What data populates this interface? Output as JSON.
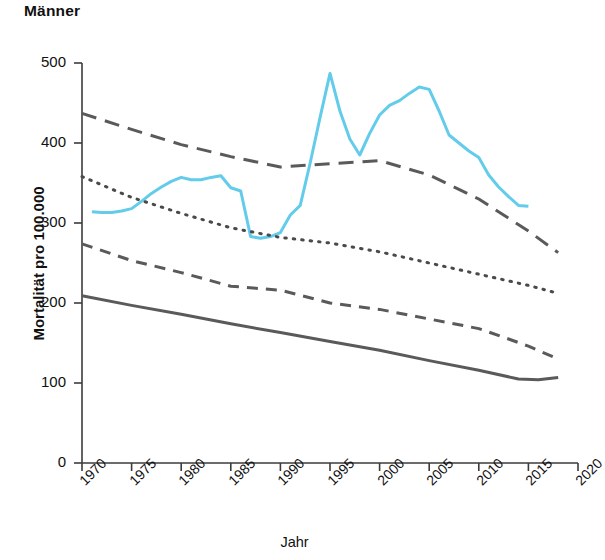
{
  "title": "Männer",
  "axes": {
    "y_label": "Mortalität pro 100.000",
    "x_label": "Jahr",
    "y_ticks": [
      "0",
      "100",
      "200",
      "300",
      "400",
      "500"
    ],
    "x_ticks": [
      "1970",
      "1975",
      "1980",
      "1985",
      "1990",
      "1995",
      "2000",
      "2005",
      "2010",
      "2015",
      "2020"
    ]
  },
  "colors": {
    "highlight": "#62CCEA",
    "line_gray": "#5a5a5a",
    "axis": "#3b3b3b",
    "text": "#111111",
    "background": "#ffffff"
  },
  "chart_data": {
    "type": "line",
    "title": "Männer",
    "xlabel": "Jahr",
    "ylabel": "Mortalität pro 100.000",
    "xlim": [
      1970,
      2020
    ],
    "ylim": [
      0,
      500
    ],
    "yticks": [
      0,
      100,
      200,
      300,
      400,
      500
    ],
    "xticks": [
      1970,
      1975,
      1980,
      1985,
      1990,
      1995,
      2000,
      2005,
      2010,
      2015,
      2020
    ],
    "grid": false,
    "legend": "none",
    "series": [
      {
        "name": "highlight-cyan",
        "style": "solid",
        "color": "#62CCEA",
        "linewidth": 3,
        "x": [
          1971,
          1972,
          1973,
          1974,
          1975,
          1976,
          1977,
          1978,
          1979,
          1980,
          1981,
          1982,
          1983,
          1984,
          1985,
          1986,
          1987,
          1988,
          1989,
          1990,
          1991,
          1992,
          1993,
          1994,
          1995,
          1996,
          1997,
          1998,
          1999,
          2000,
          2001,
          2002,
          2003,
          2004,
          2005,
          2006,
          2007,
          2008,
          2009,
          2010,
          2011,
          2012,
          2013,
          2014,
          2015
        ],
        "y": [
          314,
          313,
          313,
          315,
          318,
          327,
          337,
          345,
          352,
          357,
          354,
          354,
          357,
          359,
          344,
          340,
          283,
          281,
          283,
          288,
          310,
          322,
          375,
          432,
          487,
          440,
          405,
          385,
          412,
          435,
          447,
          453,
          462,
          470,
          467,
          440,
          410,
          400,
          390,
          382,
          360,
          345,
          333,
          322,
          321
        ]
      },
      {
        "name": "long-dash-upper",
        "style": "long-dash",
        "color": "#5a5a5a",
        "linewidth": 3,
        "x": [
          1970,
          1975,
          1980,
          1985,
          1990,
          1995,
          2000,
          2005,
          2010,
          2015,
          2018
        ],
        "y": [
          437,
          417,
          398,
          383,
          370,
          374,
          378,
          360,
          330,
          290,
          263
        ]
      },
      {
        "name": "dotted-middle",
        "style": "dotted",
        "color": "#4a4a4a",
        "linewidth": 3,
        "x": [
          1970,
          1975,
          1980,
          1985,
          1990,
          1995,
          2000,
          2005,
          2010,
          2015,
          2018
        ],
        "y": [
          358,
          332,
          312,
          294,
          282,
          275,
          264,
          250,
          236,
          222,
          212
        ]
      },
      {
        "name": "medium-dash-lower",
        "style": "medium-dash",
        "color": "#5a5a5a",
        "linewidth": 3,
        "x": [
          1970,
          1975,
          1980,
          1985,
          1990,
          1995,
          2000,
          2005,
          2010,
          2013,
          2015,
          2018
        ],
        "y": [
          274,
          253,
          238,
          221,
          216,
          200,
          192,
          180,
          168,
          155,
          146,
          130
        ]
      },
      {
        "name": "solid-bottom",
        "style": "solid",
        "color": "#5a5a5a",
        "linewidth": 3,
        "x": [
          1970,
          1975,
          1980,
          1985,
          1990,
          1995,
          2000,
          2005,
          2010,
          2014,
          2016,
          2018
        ],
        "y": [
          209,
          197,
          186,
          174,
          163,
          152,
          141,
          128,
          116,
          105,
          104,
          107
        ]
      }
    ]
  }
}
